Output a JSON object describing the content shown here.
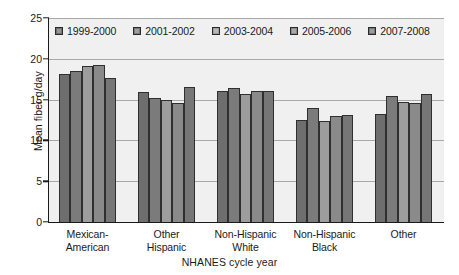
{
  "chart_data": {
    "type": "bar",
    "title": "",
    "xlabel": "NHANES cycle year",
    "ylabel": "Mean fiber g/day",
    "categories": [
      "Mexican-\nAmerican",
      "Other\nHispanic",
      "Non-Hispanic\nWhite",
      "Non-Hispanic\nBlack",
      "Other"
    ],
    "ylim": [
      0,
      25
    ],
    "yticks": [
      0,
      5,
      10,
      15,
      20,
      25
    ],
    "grid": true,
    "legend_position": "top-inside",
    "series": [
      {
        "name": "1999-2000",
        "color": "#6e6e6e",
        "values": [
          18.1,
          15.9,
          16.1,
          12.5,
          13.2
        ]
      },
      {
        "name": "2001-2002",
        "color": "#7b7b7b",
        "values": [
          18.5,
          15.2,
          16.4,
          14.0,
          15.5
        ]
      },
      {
        "name": "2003-2004",
        "color": "#9d9d9d",
        "values": [
          19.1,
          15.0,
          15.7,
          12.4,
          14.7
        ]
      },
      {
        "name": "2005-2006",
        "color": "#8a8a8a",
        "values": [
          19.2,
          14.6,
          16.0,
          13.0,
          14.6
        ]
      },
      {
        "name": "2007-2008",
        "color": "#767676",
        "values": [
          17.7,
          16.5,
          16.1,
          13.1,
          15.7
        ]
      }
    ]
  },
  "style": {
    "plot_background": "#f0f0f0",
    "axis_color": "#1a1a1a",
    "grid_color": "#a8a8a8",
    "page_background": "#ffffff"
  }
}
